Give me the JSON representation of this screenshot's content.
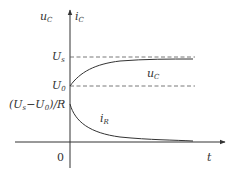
{
  "diagram": {
    "type": "time-response-plot",
    "y_axis_label_left": {
      "main": "u",
      "sub": "C"
    },
    "y_axis_label_right": {
      "main": "i",
      "sub": "C"
    },
    "x_axis_label": "t",
    "origin_label": "0",
    "levels": [
      {
        "main": "U",
        "sub": "s"
      },
      {
        "main": "U",
        "sub": "0"
      }
    ],
    "initial_current_label": {
      "text_a": "(U",
      "sub_a": "s",
      "text_b": "−U",
      "sub_b": "0",
      "text_c": ")/R"
    },
    "curves": [
      {
        "name": "u_C",
        "label_main": "u",
        "label_sub": "C",
        "description": "rises from U0 toward Us"
      },
      {
        "name": "i_R",
        "label_main": "i",
        "label_sub": "R",
        "description": "decays from (Us-U0)/R toward 0"
      }
    ],
    "colors": {
      "line": "#444444",
      "dash": "#555555",
      "text": "#333333"
    }
  }
}
